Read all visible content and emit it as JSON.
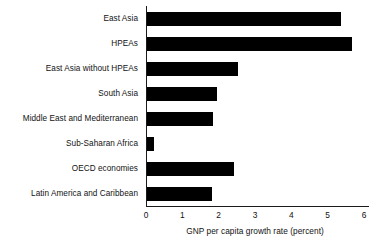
{
  "chart_data": {
    "type": "bar",
    "orientation": "horizontal",
    "title": "",
    "xlabel": "GNP per capita growth rate (percent)",
    "ylabel": "",
    "xlim": [
      0,
      6
    ],
    "xticks": [
      "0",
      "1",
      "2",
      "3",
      "4",
      "5",
      "6"
    ],
    "grid": false,
    "legend": false,
    "bar_color": "#000000",
    "axis_color": "#1a1a1a",
    "background": "#ffffff",
    "categories": [
      "East Asia",
      "HPEAs",
      "East Asia without HPEAs",
      "South Asia",
      "Middle East and Mediterranean",
      "Sub-Saharan Africa",
      "OECD economies",
      "Latin America and Caribbean"
    ],
    "values": [
      5.35,
      5.65,
      2.5,
      1.92,
      1.83,
      0.2,
      2.4,
      1.8
    ]
  }
}
